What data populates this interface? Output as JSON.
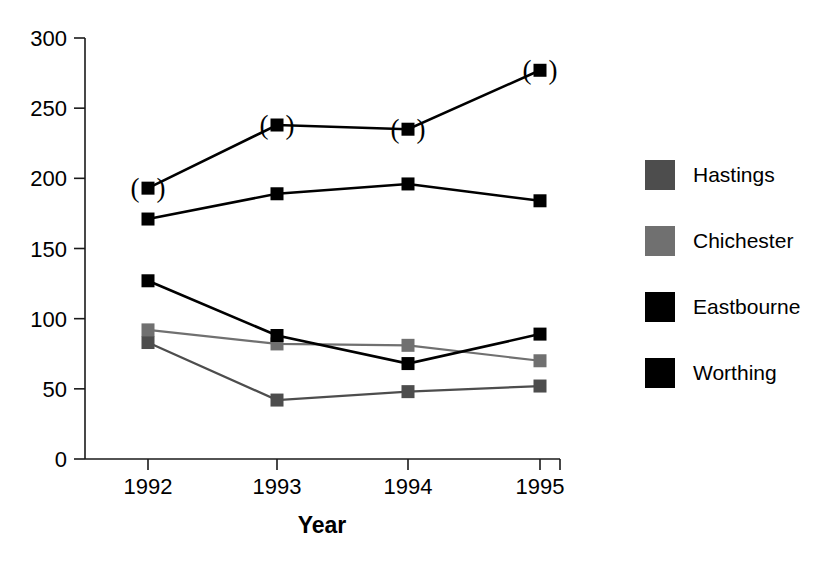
{
  "chart_data": {
    "type": "line",
    "title": "",
    "xlabel": "Year",
    "ylabel": "",
    "categories": [
      "1992",
      "1993",
      "1994",
      "1995"
    ],
    "x": [
      1992,
      1993,
      1994,
      1995
    ],
    "ylim": [
      0,
      300
    ],
    "y_ticks": [
      0,
      50,
      100,
      150,
      200,
      250,
      300
    ],
    "grid": false,
    "legend_position": "right",
    "series": [
      {
        "name": "Hastings",
        "color": "#4d4d4d",
        "marker": "square",
        "values": [
          83,
          42,
          48,
          52
        ]
      },
      {
        "name": "Chichester",
        "color": "#707070",
        "marker": "square",
        "values": [
          92,
          82,
          81,
          70
        ]
      },
      {
        "name": "Eastbourne",
        "color": "#000000",
        "marker": "square",
        "values": [
          127,
          88,
          68,
          89
        ]
      },
      {
        "name": "Worthing",
        "color": "#000000",
        "marker": "square",
        "values": [
          171,
          189,
          196,
          184
        ]
      }
    ],
    "annotations": [
      {
        "text": "(",
        "note": "parenthesis marks around upper series points",
        "points": [
          [
            1992,
            193
          ],
          [
            1993,
            238
          ],
          [
            1994,
            235
          ],
          [
            1995,
            277
          ]
        ]
      }
    ],
    "extra_series": {
      "name": "Worthing (bracketed)",
      "color": "#000000",
      "values": [
        193,
        238,
        235,
        277
      ],
      "bracketed": true
    }
  },
  "legend": {
    "items": [
      {
        "label": "Hastings",
        "swatch": "#4d4d4d"
      },
      {
        "label": "Chichester",
        "swatch": "#707070"
      },
      {
        "label": "Eastbourne",
        "swatch": "#000000"
      },
      {
        "label": "Worthing",
        "swatch": "#000000"
      }
    ]
  },
  "axes": {
    "y_labels": [
      "300",
      "250",
      "200",
      "150",
      "100",
      "50",
      "0"
    ],
    "x_labels": [
      "1992",
      "1993",
      "1994",
      "1995"
    ],
    "x_title": "Year"
  }
}
